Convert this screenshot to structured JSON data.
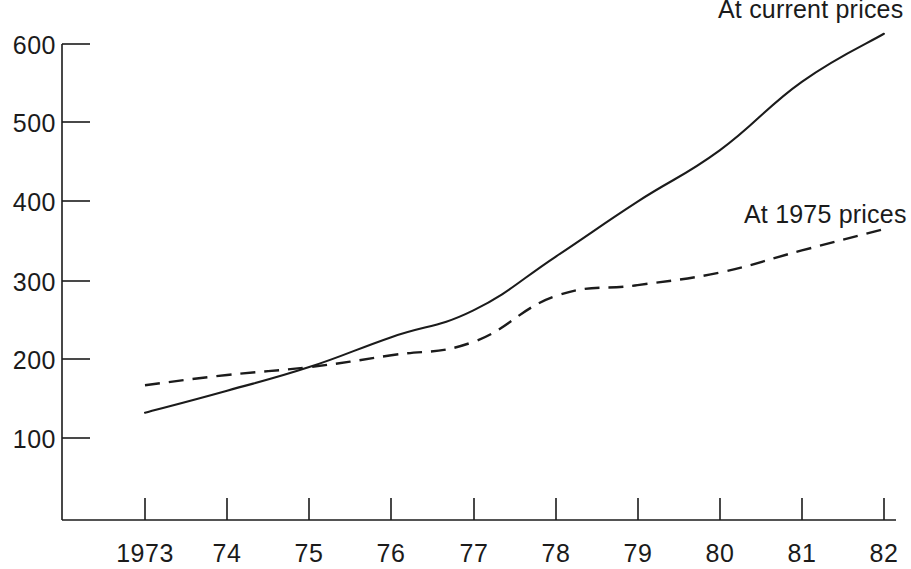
{
  "chart_data": {
    "type": "line",
    "title": "",
    "subtitle": "",
    "xlabel": "",
    "ylabel": "",
    "grid": false,
    "legend_position": "inline-right-end-of-series",
    "x": [
      "1973",
      "74",
      "75",
      "76",
      "77",
      "78",
      "79",
      "80",
      "81",
      "82"
    ],
    "x_tick_labels": [
      "1973",
      "74",
      "75",
      "76",
      "77",
      "78",
      "79",
      "80",
      "81",
      "82"
    ],
    "y_tick_labels": [
      "100",
      "200",
      "300",
      "400",
      "500",
      "600"
    ],
    "y_ticks": [
      100,
      200,
      300,
      400,
      500,
      600
    ],
    "ylim": [
      60,
      625
    ],
    "xlim": [
      "1973",
      "82"
    ],
    "series": [
      {
        "name": "At current prices",
        "style": "solid",
        "color": "#1b1b1b",
        "values": [
          132,
          160,
          190,
          228,
          262,
          330,
          400,
          465,
          552,
          613
        ]
      },
      {
        "name": "At 1975 prices",
        "style": "dashed",
        "color": "#1b1b1b",
        "values": [
          167,
          180,
          190,
          205,
          222,
          280,
          294,
          310,
          338,
          365
        ]
      }
    ],
    "annotations": [
      {
        "text": "At current prices",
        "series": "At current prices"
      },
      {
        "text": "At 1975 prices",
        "series": "At 1975 prices"
      }
    ]
  },
  "labels": {
    "series_current_prices": "At current prices",
    "series_1975_prices": "At 1975 prices",
    "y": {
      "t600": "600",
      "t500": "500",
      "t400": "400",
      "t300": "300",
      "t200": "200",
      "t100": "100"
    },
    "x": {
      "t1973": "1973",
      "t74": "74",
      "t75": "75",
      "t76": "76",
      "t77": "77",
      "t78": "78",
      "t79": "79",
      "t80": "80",
      "t81": "81",
      "t82": "82"
    }
  },
  "colors": {
    "ink": "#1b1b1b",
    "background": "#ffffff"
  }
}
